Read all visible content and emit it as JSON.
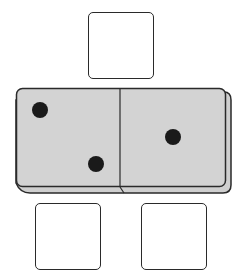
{
  "figure": {
    "domino": {
      "left_half": {
        "pips": 2
      },
      "right_half": {
        "pips": 1
      },
      "face_color": "#d3d3d3",
      "edge_color": "#2a2a2a",
      "pip_color": "#1a1a1a"
    },
    "answer_boxes": [
      {
        "position": "top",
        "value": ""
      },
      {
        "position": "bottom-left",
        "value": ""
      },
      {
        "position": "bottom-right",
        "value": ""
      }
    ]
  }
}
